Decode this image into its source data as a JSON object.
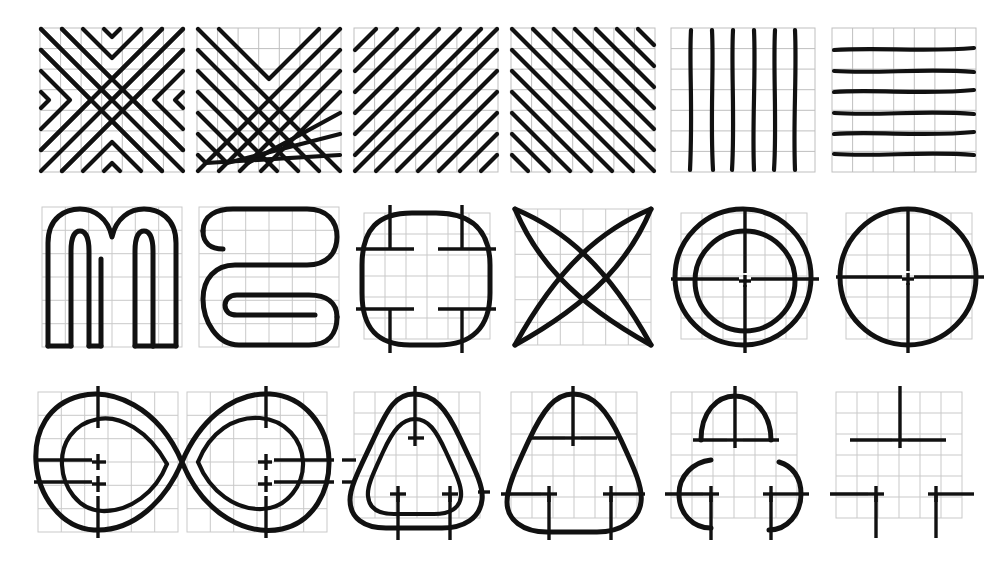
{
  "document": {
    "title": "Hand-drawn figure plate",
    "description": "Plate of eighteen hand-drawn figures on square graph paper, arranged in three rows of six cells.",
    "background_color": "#ffffff",
    "grid_color": "#bfbfbf",
    "ink_color": "#111111",
    "rows": 3,
    "columns": 6
  },
  "rows": [
    {
      "row_index": 1,
      "row_name": "line-pattern-row",
      "cells": [
        {
          "index": 1,
          "name": "x-chevron-pattern",
          "label": "nested X chevrons",
          "grid": "7x7",
          "figure_type": "pattern"
        },
        {
          "index": 2,
          "name": "v-chevron-pattern",
          "label": "nested V chevrons",
          "grid": "7x7",
          "figure_type": "pattern"
        },
        {
          "index": 3,
          "name": "diagonal-up-hatching",
          "label": "diagonal lines up-right",
          "grid": "7x7",
          "figure_type": "pattern"
        },
        {
          "index": 4,
          "name": "diagonal-down-hatching",
          "label": "diagonal lines down-right",
          "grid": "7x7",
          "figure_type": "pattern"
        },
        {
          "index": 5,
          "name": "vertical-lines",
          "label": "six vertical lines",
          "grid": "7x7",
          "figure_type": "pattern"
        },
        {
          "index": 6,
          "name": "horizontal-lines",
          "label": "six horizontal lines",
          "grid": "7x7",
          "figure_type": "pattern"
        }
      ]
    },
    {
      "row_index": 2,
      "row_name": "letter-and-shape-row",
      "cells": [
        {
          "index": 1,
          "name": "letter-m-outline",
          "label": "outlined letter m",
          "grid": "6x6",
          "figure_type": "letterform"
        },
        {
          "index": 2,
          "name": "serpentine-s-outline",
          "label": "outlined serpentine S",
          "grid": "6x6",
          "figure_type": "letterform"
        },
        {
          "index": 3,
          "name": "rounded-square",
          "label": "rounded square with registration ticks",
          "grid": "6x6",
          "figure_type": "shape",
          "ticks": 4
        },
        {
          "index": 4,
          "name": "four-arc-star",
          "label": "four crossing arcs star",
          "grid": "6x6",
          "figure_type": "shape"
        },
        {
          "index": 5,
          "name": "concentric-circles",
          "label": "two concentric circles with crosshair",
          "grid": "6x6",
          "figure_type": "shape",
          "ticks": 1
        },
        {
          "index": 6,
          "name": "single-circle",
          "label": "single circle with crosshair",
          "grid": "6x6",
          "figure_type": "shape",
          "ticks": 1
        }
      ]
    },
    {
      "row_index": 3,
      "row_name": "progressive-shape-row",
      "cells": [
        {
          "index": 1,
          "name": "infinity-loop",
          "label": "double infinity loop spanning two cells",
          "grid": "6x6 (wide)",
          "figure_type": "shape",
          "ticks": 4,
          "span": 2
        },
        {
          "index": 2,
          "name": "concentric-rounded-triangles",
          "label": "two concentric rounded triangles",
          "grid": "6x6",
          "figure_type": "shape",
          "ticks": 3
        },
        {
          "index": 3,
          "name": "rounded-triangle",
          "label": "single rounded triangle",
          "grid": "6x6",
          "figure_type": "shape",
          "ticks": 3
        },
        {
          "index": 4,
          "name": "partial-arcs",
          "label": "decomposed partial arcs",
          "grid": "6x6",
          "figure_type": "shape",
          "ticks": 3
        },
        {
          "index": 5,
          "name": "ticks-only",
          "label": "registration ticks only, no figure",
          "grid": "6x6",
          "figure_type": "ticks",
          "ticks": 3
        }
      ]
    }
  ]
}
